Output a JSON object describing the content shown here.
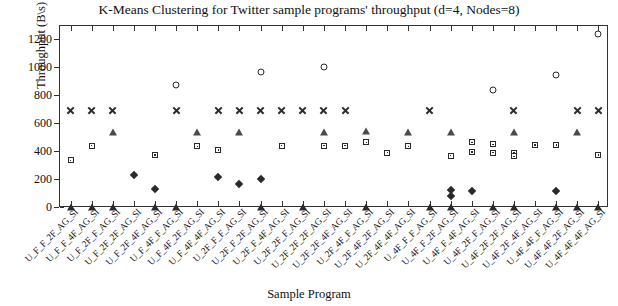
{
  "chart_data": {
    "type": "scatter",
    "title": "K-Means Clustering for Twitter sample programs' throughput (d=4, Nodes=8)",
    "xlabel": "Sample Program",
    "ylabel": "Throughput (B\\s)",
    "ylim": [
      0,
      1300
    ],
    "yticks": [
      0,
      200,
      400,
      600,
      800,
      1000,
      1200
    ],
    "grid": false,
    "legend": "none",
    "categories": [
      "U_F_F_2F_AG_SI",
      "U_F_F_4F_AG_SI",
      "U_F_2F_F_AG_SI",
      "U_F_2F_2F_AG_SI",
      "U_F_2F_4F_AG_SI",
      "U_F_4F_F_AG_SI",
      "U_F_4F_2F_AG_SI",
      "U_F_4F_4F_AG_SI",
      "U_2F_F_F_AG_SI",
      "U_2F_F_2F_AG_SI",
      "U_2F_F_4F_AG_SI",
      "U_2F_2F_F_AG_SI",
      "U_2F_2F_2F_AG_SI",
      "U_2F_2F_4F_AG_SI",
      "U_2F_4F_F_AG_SI",
      "U_2F_4F_2F_AG_SI",
      "U_2F_4F_4F_AG_SI",
      "U_4F_F_F_AG_SI",
      "U_4F_F_2F_AG_SI",
      "U_4F_F_4F_AG_SI",
      "U_4F_2F_F_AG_SI",
      "U_4F_2F_2F_AG_SI",
      "U_4F_2F_4F_AG_SI",
      "U_4F_4F_F_AG_SI",
      "U_4F_4F_2F_AG_SI",
      "U_4F_4F_4F_AG_SI"
    ],
    "series": [
      {
        "name": "cluster-circle",
        "marker": "circle",
        "points": [
          {
            "x": 5,
            "y": 880
          },
          {
            "x": 9,
            "y": 975
          },
          {
            "x": 12,
            "y": 1010
          },
          {
            "x": 20,
            "y": 845
          },
          {
            "x": 23,
            "y": 950
          },
          {
            "x": 25,
            "y": 1240
          }
        ]
      },
      {
        "name": "cluster-x",
        "marker": "x",
        "points": [
          {
            "x": 0,
            "y": 700
          },
          {
            "x": 1,
            "y": 700
          },
          {
            "x": 2,
            "y": 700
          },
          {
            "x": 5,
            "y": 700
          },
          {
            "x": 7,
            "y": 700
          },
          {
            "x": 8,
            "y": 700
          },
          {
            "x": 9,
            "y": 700
          },
          {
            "x": 10,
            "y": 700
          },
          {
            "x": 11,
            "y": 700
          },
          {
            "x": 12,
            "y": 700
          },
          {
            "x": 13,
            "y": 700
          },
          {
            "x": 17,
            "y": 700
          },
          {
            "x": 21,
            "y": 700
          },
          {
            "x": 24,
            "y": 700
          },
          {
            "x": 25,
            "y": 700
          }
        ]
      },
      {
        "name": "cluster-triangle",
        "marker": "triangle",
        "points": [
          {
            "x": 2,
            "y": 545
          },
          {
            "x": 6,
            "y": 545
          },
          {
            "x": 8,
            "y": 545
          },
          {
            "x": 12,
            "y": 545
          },
          {
            "x": 14,
            "y": 550
          },
          {
            "x": 16,
            "y": 545
          },
          {
            "x": 18,
            "y": 545
          },
          {
            "x": 21,
            "y": 545
          },
          {
            "x": 24,
            "y": 545
          }
        ]
      },
      {
        "name": "cluster-square",
        "marker": "square",
        "points": [
          {
            "x": 0,
            "y": 340
          },
          {
            "x": 1,
            "y": 445
          },
          {
            "x": 4,
            "y": 380
          },
          {
            "x": 6,
            "y": 440
          },
          {
            "x": 7,
            "y": 415
          },
          {
            "x": 10,
            "y": 445
          },
          {
            "x": 12,
            "y": 445
          },
          {
            "x": 13,
            "y": 445
          },
          {
            "x": 14,
            "y": 470
          },
          {
            "x": 15,
            "y": 395
          },
          {
            "x": 16,
            "y": 440
          },
          {
            "x": 18,
            "y": 375
          },
          {
            "x": 19,
            "y": 470
          },
          {
            "x": 19,
            "y": 400
          },
          {
            "x": 20,
            "y": 455
          },
          {
            "x": 20,
            "y": 395
          },
          {
            "x": 21,
            "y": 395
          },
          {
            "x": 21,
            "y": 370
          },
          {
            "x": 22,
            "y": 450
          },
          {
            "x": 23,
            "y": 450
          },
          {
            "x": 25,
            "y": 380
          }
        ]
      },
      {
        "name": "cluster-diamond",
        "marker": "diamond",
        "points": [
          {
            "x": 3,
            "y": 235
          },
          {
            "x": 4,
            "y": 135
          },
          {
            "x": 7,
            "y": 225
          },
          {
            "x": 8,
            "y": 170
          },
          {
            "x": 9,
            "y": 205
          },
          {
            "x": 18,
            "y": 130
          },
          {
            "x": 18,
            "y": 85
          },
          {
            "x": 19,
            "y": 120
          },
          {
            "x": 23,
            "y": 125
          }
        ]
      },
      {
        "name": "cluster-baseline",
        "marker": "triangle-filled",
        "points": [
          {
            "x": 0,
            "y": 10
          },
          {
            "x": 1,
            "y": 10
          },
          {
            "x": 2,
            "y": 10
          },
          {
            "x": 4,
            "y": 10
          },
          {
            "x": 5,
            "y": 10
          },
          {
            "x": 9,
            "y": 10
          },
          {
            "x": 11,
            "y": 10
          },
          {
            "x": 14,
            "y": 10
          },
          {
            "x": 17,
            "y": 10
          },
          {
            "x": 18,
            "y": 10
          },
          {
            "x": 20,
            "y": 10
          },
          {
            "x": 21,
            "y": 10
          },
          {
            "x": 23,
            "y": 10
          },
          {
            "x": 24,
            "y": 10
          },
          {
            "x": 25,
            "y": 10
          }
        ]
      }
    ]
  }
}
